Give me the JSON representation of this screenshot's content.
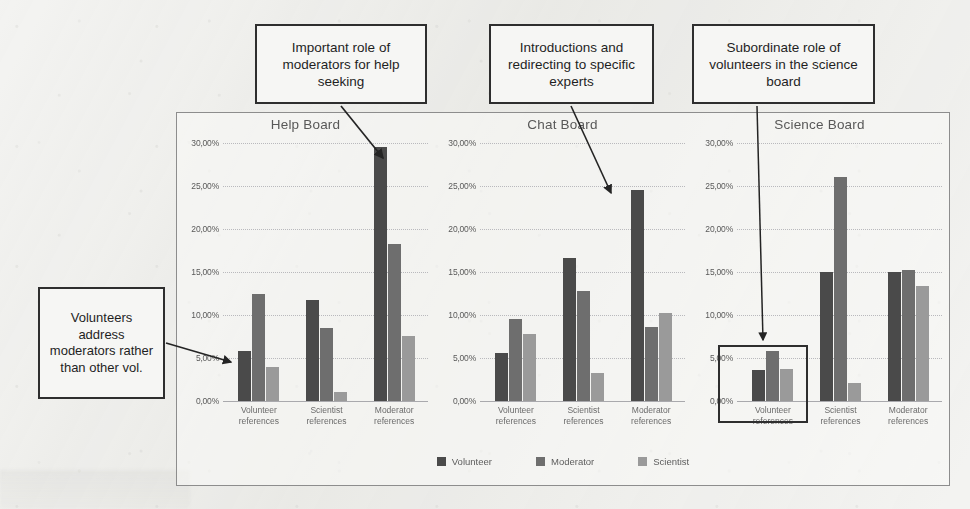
{
  "chart_data": {
    "type": "bar",
    "title": "",
    "xlabel": "",
    "ylabel": "",
    "ylim": [
      0,
      30
    ],
    "grid": true,
    "legend_position": "bottom",
    "y_tick_labels": [
      "30,00%",
      "25,00%",
      "20,00%",
      "15,00%",
      "10,00%",
      "5,00%",
      "0,00%"
    ],
    "y_tick_values": [
      30,
      25,
      20,
      15,
      10,
      5,
      0
    ],
    "categories": [
      "Volunteer references",
      "Scientist references",
      "Moderator references"
    ],
    "series_names": [
      "Volunteer",
      "Moderator",
      "Scientist"
    ],
    "panels": [
      {
        "title": "Help Board",
        "series": [
          {
            "name": "Volunteer",
            "values": [
              5.8,
              11.8,
              29.5
            ]
          },
          {
            "name": "Moderator",
            "values": [
              12.5,
              8.5,
              18.2
            ]
          },
          {
            "name": "Scientist",
            "values": [
              4.0,
              1.0,
              7.6
            ]
          }
        ]
      },
      {
        "title": "Chat Board",
        "series": [
          {
            "name": "Volunteer",
            "values": [
              5.6,
              16.6,
              24.5
            ]
          },
          {
            "name": "Moderator",
            "values": [
              9.5,
              12.8,
              8.6
            ]
          },
          {
            "name": "Scientist",
            "values": [
              7.8,
              3.3,
              10.2
            ]
          }
        ]
      },
      {
        "title": "Science Board",
        "series": [
          {
            "name": "Volunteer",
            "values": [
              3.6,
              15.0,
              15.0
            ]
          },
          {
            "name": "Moderator",
            "values": [
              5.8,
              26.0,
              15.2
            ]
          },
          {
            "name": "Scientist",
            "values": [
              3.7,
              2.1,
              13.4
            ]
          }
        ]
      }
    ],
    "series_colors": {
      "Volunteer": "#4a4a4a",
      "Moderator": "#6e6e6e",
      "Scientist": "#9a9a9a"
    }
  },
  "legend": {
    "items": [
      {
        "label": "Volunteer",
        "color": "#4a4a4a"
      },
      {
        "label": "Moderator",
        "color": "#6e6e6e"
      },
      {
        "label": "Scientist",
        "color": "#9a9a9a"
      }
    ]
  },
  "annotations": {
    "callout_help": "Important role of moderators for help seeking",
    "callout_chat": "Introductions and redirecting to specific experts",
    "callout_science": "Subordinate role of volunteers in the science board",
    "callout_left": "Volunteers address moderators rather than other vol."
  }
}
